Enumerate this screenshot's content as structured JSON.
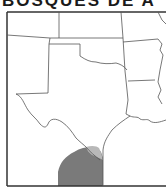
{
  "title": "BOSQUES DE A",
  "map": {
    "region": "Texas and surrounding states",
    "states_visible": [
      "New Mexico",
      "Colorado",
      "Kansas",
      "Oklahoma",
      "Texas",
      "Arkansas",
      "Louisiana",
      "Missouri"
    ],
    "highlighted_range": {
      "description": "South Texas / northeastern Mexico range",
      "fill_color": "#7a7a7a",
      "edge_color": "#b8b8b8"
    },
    "colors": {
      "border": "#555555",
      "frame": "#333333",
      "background": "#ffffff"
    }
  }
}
